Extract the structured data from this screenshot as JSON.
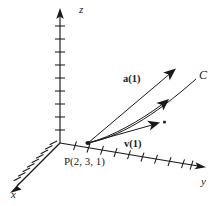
{
  "figure": {
    "kind": "3d-vector-diagram",
    "background_color": "#ffffff",
    "ink_color": "#1a1a1a",
    "width": 216,
    "height": 206
  },
  "axes": {
    "z": {
      "label": "z",
      "tick_count": 9,
      "arrow": "up"
    },
    "y": {
      "label": "y",
      "tick_count": 10,
      "arrow": "right-down"
    },
    "x": {
      "label": "x",
      "tick_count": 9,
      "arrow": "left-down"
    },
    "origin": {
      "x": 60,
      "y": 143
    }
  },
  "point": {
    "name": "P",
    "label": "P(2, 3, 1)",
    "coords_text": "(2, 3, 1)",
    "coordinates": [
      2,
      3,
      1
    ],
    "position": {
      "x": 88,
      "y": 143
    }
  },
  "curve": {
    "label": "C",
    "name": "curve-C"
  },
  "vectors": [
    {
      "id": "acceleration",
      "label": "a(1)",
      "name": "acceleration-vector",
      "from": {
        "x": 88,
        "y": 143
      },
      "to": {
        "x": 173,
        "y": 71
      }
    },
    {
      "id": "tangent",
      "label": "",
      "name": "tangent-vector",
      "from": {
        "x": 88,
        "y": 143
      },
      "to": {
        "x": 167,
        "y": 101
      }
    },
    {
      "id": "velocity",
      "label": "v(1)",
      "name": "velocity-vector",
      "from": {
        "x": 88,
        "y": 143
      },
      "to": {
        "x": 158,
        "y": 123
      }
    }
  ],
  "marks": {
    "tip_dot": {
      "x": 164,
      "y": 122,
      "name": "velocity-tip-dot"
    }
  }
}
